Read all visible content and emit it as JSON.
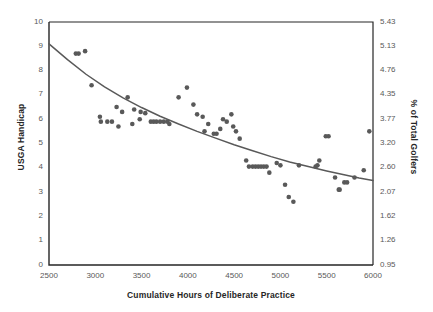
{
  "chart_data": {
    "type": "scatter",
    "title": "",
    "xlabel": "Cumulative Hours of Deliberate Practice",
    "ylabel": "USGA Handicap",
    "y2label": "% of Total Golfers",
    "xlim": [
      2500,
      6000
    ],
    "ylim": [
      0,
      10
    ],
    "grid": false,
    "legend": false,
    "xticks": [
      2500,
      3000,
      3500,
      4000,
      4500,
      5000,
      5500,
      6000
    ],
    "xtick_labels": [
      "2500",
      "3000",
      "3500",
      "4000",
      "4500",
      "5000",
      "5500",
      "6000"
    ],
    "yticks": [
      0,
      1,
      2,
      3,
      4,
      5,
      6,
      7,
      8,
      9,
      10
    ],
    "ytick_labels": [
      "0",
      "1",
      "2",
      "3",
      "4",
      "5",
      "6",
      "7",
      "8",
      "9",
      "10"
    ],
    "y2ticks": [
      0.95,
      1.26,
      1.62,
      2.07,
      2.6,
      3.2,
      3.77,
      4.35,
      4.76,
      5.13,
      5.43
    ],
    "y2tick_labels": [
      "0.95",
      "1.26",
      "1.62",
      "2.07",
      "2.60",
      "3.20",
      "3.77",
      "4.35",
      "4.76",
      "5.13",
      "5.43"
    ],
    "marker_color": "#595959",
    "line_color": "#595959",
    "axis_color": "#262626",
    "series": [
      {
        "name": "Golfer observations",
        "type": "scatter",
        "points": [
          [
            2790,
            8.7
          ],
          [
            2820,
            8.7
          ],
          [
            2890,
            8.8
          ],
          [
            2960,
            7.4
          ],
          [
            3050,
            6.1
          ],
          [
            3060,
            5.9
          ],
          [
            3130,
            5.9
          ],
          [
            3180,
            5.9
          ],
          [
            3230,
            6.5
          ],
          [
            3250,
            5.7
          ],
          [
            3290,
            6.3
          ],
          [
            3350,
            6.9
          ],
          [
            3400,
            5.8
          ],
          [
            3420,
            6.4
          ],
          [
            3480,
            6.0
          ],
          [
            3490,
            6.3
          ],
          [
            3540,
            6.25
          ],
          [
            3600,
            5.9
          ],
          [
            3630,
            5.9
          ],
          [
            3660,
            5.9
          ],
          [
            3700,
            5.9
          ],
          [
            3740,
            5.9
          ],
          [
            3780,
            5.9
          ],
          [
            3800,
            5.8
          ],
          [
            3900,
            6.9
          ],
          [
            3990,
            7.3
          ],
          [
            4060,
            6.6
          ],
          [
            4100,
            6.2
          ],
          [
            4160,
            6.1
          ],
          [
            4180,
            5.5
          ],
          [
            4220,
            5.8
          ],
          [
            4280,
            5.4
          ],
          [
            4310,
            5.4
          ],
          [
            4350,
            5.6
          ],
          [
            4380,
            6.0
          ],
          [
            4420,
            5.9
          ],
          [
            4470,
            6.2
          ],
          [
            4490,
            5.7
          ],
          [
            4520,
            5.5
          ],
          [
            4560,
            5.2
          ],
          [
            4630,
            4.3
          ],
          [
            4660,
            4.05
          ],
          [
            4700,
            4.05
          ],
          [
            4730,
            4.05
          ],
          [
            4760,
            4.05
          ],
          [
            4790,
            4.05
          ],
          [
            4820,
            4.05
          ],
          [
            4850,
            4.05
          ],
          [
            4880,
            3.8
          ],
          [
            4960,
            4.2
          ],
          [
            5000,
            4.1
          ],
          [
            5050,
            3.3
          ],
          [
            5090,
            2.8
          ],
          [
            5140,
            2.6
          ],
          [
            5200,
            4.1
          ],
          [
            5380,
            4.05
          ],
          [
            5400,
            4.1
          ],
          [
            5420,
            4.3
          ],
          [
            5490,
            5.3
          ],
          [
            5520,
            5.3
          ],
          [
            5590,
            3.6
          ],
          [
            5630,
            3.1
          ],
          [
            5640,
            3.1
          ],
          [
            5690,
            3.4
          ],
          [
            5720,
            3.4
          ],
          [
            5800,
            3.6
          ],
          [
            5900,
            3.9
          ],
          [
            5960,
            5.5
          ]
        ]
      },
      {
        "name": "Trend line",
        "type": "line",
        "points": [
          [
            2500,
            9.1
          ],
          [
            2700,
            8.45
          ],
          [
            2900,
            7.85
          ],
          [
            3100,
            7.33
          ],
          [
            3300,
            6.88
          ],
          [
            3500,
            6.48
          ],
          [
            3700,
            6.12
          ],
          [
            3900,
            5.8
          ],
          [
            4100,
            5.5
          ],
          [
            4300,
            5.22
          ],
          [
            4500,
            4.95
          ],
          [
            4700,
            4.7
          ],
          [
            4900,
            4.46
          ],
          [
            5100,
            4.24
          ],
          [
            5300,
            4.05
          ],
          [
            5500,
            3.87
          ],
          [
            5700,
            3.7
          ],
          [
            5850,
            3.58
          ],
          [
            6000,
            3.48
          ]
        ]
      }
    ]
  },
  "plot_geometry": {
    "left": 49,
    "top": 22,
    "right": 373,
    "bottom": 265
  }
}
